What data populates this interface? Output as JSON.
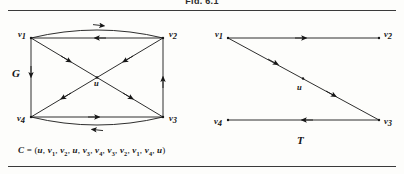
{
  "figure": {
    "top_caption": "Fig. 6.1",
    "graphs": [
      {
        "id": "graph-g",
        "label": "G",
        "vertices": [
          {
            "name": "v1",
            "label": "v",
            "subscript": "1"
          },
          {
            "name": "v2",
            "label": "v",
            "subscript": "2"
          },
          {
            "name": "v3",
            "label": "v",
            "subscript": "3"
          },
          {
            "name": "v4",
            "label": "v",
            "subscript": "4"
          },
          {
            "name": "u",
            "label": "u",
            "subscript": ""
          }
        ]
      },
      {
        "id": "graph-t",
        "label": "T",
        "vertices": [
          {
            "name": "v1",
            "label": "v",
            "subscript": "1"
          },
          {
            "name": "v2",
            "label": "v",
            "subscript": "2"
          },
          {
            "name": "v3",
            "label": "v",
            "subscript": "3"
          },
          {
            "name": "v4",
            "label": "v",
            "subscript": "4"
          },
          {
            "name": "u",
            "label": "u",
            "subscript": ""
          }
        ]
      }
    ],
    "cycle_caption": {
      "name": "C",
      "equals": "=",
      "open": "(",
      "sequence": [
        "u",
        "v1",
        "v2",
        "u",
        "v3",
        "v4",
        "v3",
        "v2",
        "v1",
        "v4",
        "u"
      ],
      "close": ")",
      "full_text": "C = (u, v1, v2, u, v3, v4, v3, v2, v1, v4, u)"
    },
    "colors": {
      "ink": "#161616",
      "rule": "#3a3a3a",
      "paper": "#fdfdfb"
    }
  }
}
